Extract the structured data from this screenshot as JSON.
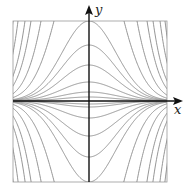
{
  "chart_data": {
    "type": "line",
    "title": "",
    "xlabel": "x",
    "ylabel": "y",
    "grid": false,
    "legend": null,
    "frame": {
      "left": 13,
      "top": 21,
      "right": 167,
      "bottom": 182
    },
    "origin_px": {
      "x": 89,
      "y": 101
    },
    "x_scale_px": 38,
    "curve_C_values_px": [
      4,
      9,
      19,
      36,
      56,
      80,
      187,
      395,
      824,
      1368,
      2630,
      4370,
      6,
      3,
      17,
      35,
      56,
      81,
      187,
      395,
      824,
      1368,
      2630,
      4370
    ],
    "curve_signs": [
      1,
      1,
      1,
      1,
      1,
      1,
      1,
      1,
      1,
      1,
      1,
      1,
      -1,
      -1,
      -1,
      -1,
      -1,
      -1,
      -1,
      -1,
      -1,
      -1,
      -1,
      -1
    ],
    "colors": {
      "curve": "#8a8a8a",
      "axis": "#111111",
      "frame": "#9a9a9a"
    }
  },
  "labels": {
    "x_axis": "x",
    "y_axis": "y"
  }
}
